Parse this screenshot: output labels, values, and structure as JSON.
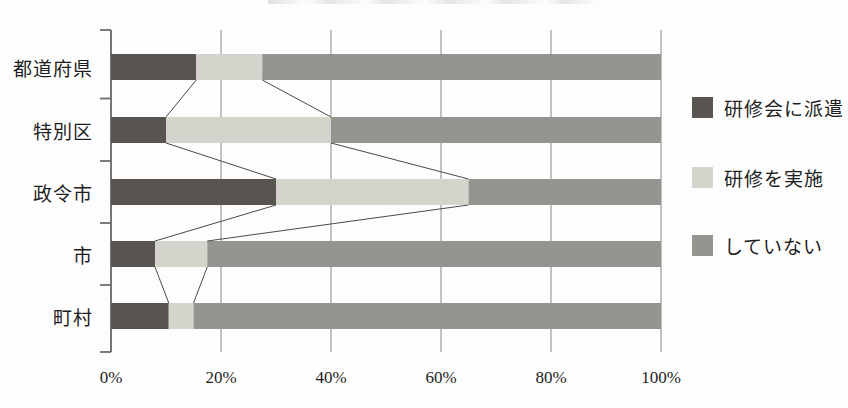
{
  "chart_data": {
    "type": "bar",
    "orientation": "horizontal",
    "stacked": true,
    "stack_unit": "percent",
    "title": "",
    "subtitle": "",
    "xlabel": "",
    "ylabel": "",
    "xlim": [
      0,
      100
    ],
    "grid": true,
    "grid_axis": "x",
    "legend_position": "right",
    "categories": [
      "都道府県",
      "特別区",
      "政令市",
      "市",
      "町村"
    ],
    "tick_labels": [
      "0%",
      "20%",
      "40%",
      "60%",
      "80%",
      "100%"
    ],
    "tick_values": [
      0,
      20,
      40,
      60,
      80,
      100
    ],
    "series": [
      {
        "name": "研修会に派遣",
        "color": "#585551",
        "values": [
          15.5,
          10.0,
          30.0,
          8.0,
          10.5
        ]
      },
      {
        "name": "研修を実施",
        "color": "#d4d4cd",
        "values": [
          12.0,
          30.0,
          35.0,
          9.5,
          4.5
        ]
      },
      {
        "name": "していない",
        "color": "#959590",
        "values": [
          72.5,
          60.0,
          35.0,
          82.5,
          85.0
        ]
      }
    ],
    "connector_lines": true,
    "annotations": []
  },
  "axis": {
    "line_color": "#6e6e6e",
    "grid_color": "#a8a8a8"
  }
}
